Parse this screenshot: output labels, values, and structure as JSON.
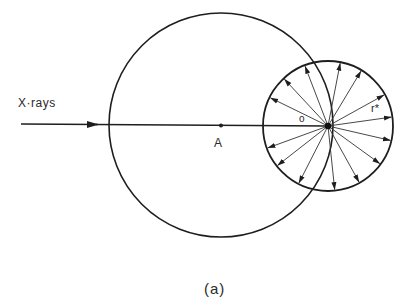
{
  "labels": {
    "xrays": "X·rays",
    "point_a": "A",
    "origin": "o",
    "radius": "r*",
    "caption": "(a)"
  },
  "geometry": {
    "big_circle": {
      "cx": 221,
      "cy": 125,
      "r": 112
    },
    "small_circle": {
      "cx": 328,
      "cy": 126,
      "r": 65
    },
    "beam": {
      "x1": 21,
      "y1": 124,
      "x2": 328,
      "y2": 126,
      "arrow_x": 98
    },
    "ray_angles_deg": [
      8,
      29,
      59,
      79,
      111,
      133,
      154,
      200,
      218,
      243,
      276,
      299,
      324,
      347
    ]
  },
  "colors": {
    "stroke": "#1e1e1e",
    "background": "#ffffff"
  }
}
